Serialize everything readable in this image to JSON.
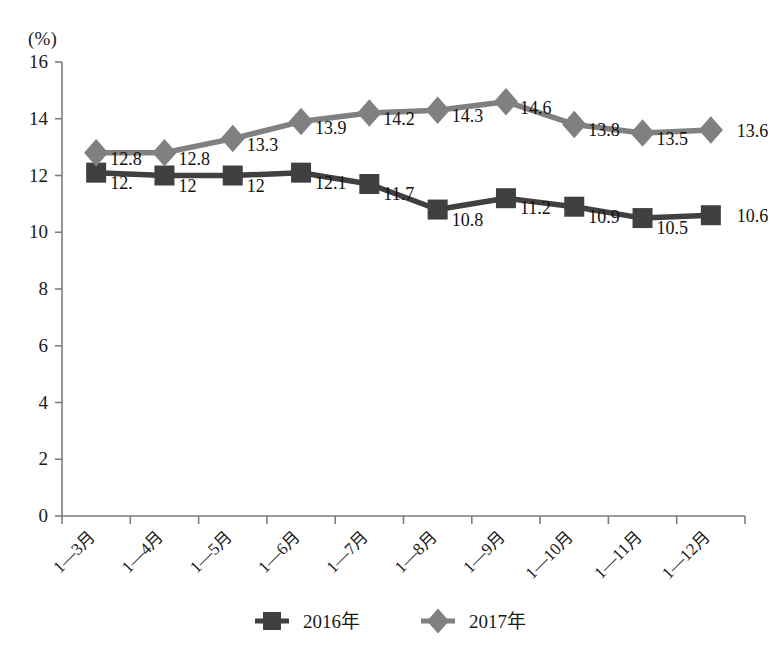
{
  "chart_data": {
    "type": "line",
    "title": "",
    "xlabel": "",
    "ylabel": "",
    "unit_label": "(%)",
    "ylim": [
      0,
      16
    ],
    "yticks": [
      0,
      2,
      4,
      6,
      8,
      10,
      12,
      14,
      16
    ],
    "grid": false,
    "legend_position": "bottom",
    "categories": [
      "1—3月",
      "1—4月",
      "1—5月",
      "1—6月",
      "1—7月",
      "1—8月",
      "1—9月",
      "1—10月",
      "1—11月",
      "1—12月"
    ],
    "series": [
      {
        "name": "2016年",
        "color": "#404040",
        "marker": "square",
        "values": [
          12.1,
          12.0,
          12.0,
          12.1,
          11.7,
          10.8,
          11.2,
          10.9,
          10.5,
          10.6
        ],
        "labels": [
          "12.",
          "12",
          "12",
          "12.1",
          "11.7",
          "10.8",
          "11.2",
          "10.9",
          "10.5",
          "10.6"
        ]
      },
      {
        "name": "2017年",
        "color": "#808080",
        "marker": "diamond",
        "values": [
          12.8,
          12.8,
          13.3,
          13.9,
          14.2,
          14.3,
          14.6,
          13.8,
          13.5,
          13.6
        ],
        "labels": [
          "12.8",
          "12.8",
          "13.3",
          "13.9",
          "14.2",
          "14.3",
          "14.6",
          "13.8",
          "13.5",
          "13.6"
        ]
      }
    ]
  },
  "axes": {
    "unit": "(%)",
    "y_tick_labels": [
      "16",
      "14",
      "12",
      "10",
      "8",
      "6",
      "4",
      "2",
      "0"
    ],
    "axis_color": "#7d7d7d"
  },
  "legend": {
    "items": [
      {
        "label": "2016年",
        "color": "#404040",
        "marker": "square"
      },
      {
        "label": "2017年",
        "color": "#808080",
        "marker": "diamond"
      }
    ]
  }
}
